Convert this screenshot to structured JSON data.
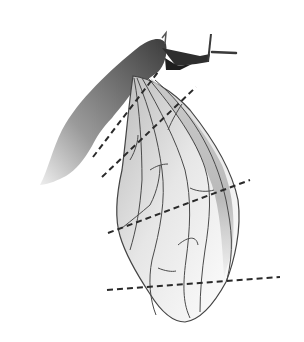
{
  "figure": {
    "background": "#ffffff",
    "colors": {
      "body_dark": "#3a3a3a",
      "body_light": "#d8d8d8",
      "vein": "#4a4a4a",
      "wing_shade": "#bdbdbd",
      "dashed_line": "#2a2a2a"
    },
    "dashed_lines": [
      {
        "id": "line-1",
        "x1": 93,
        "y1": 157,
        "x2": 158,
        "y2": 72
      },
      {
        "id": "line-2",
        "x1": 102,
        "y1": 177,
        "x2": 196,
        "y2": 87
      },
      {
        "id": "line-3",
        "x1": 108,
        "y1": 233,
        "x2": 250,
        "y2": 180
      },
      {
        "id": "line-4",
        "x1": 107,
        "y1": 290,
        "x2": 280,
        "y2": 277
      }
    ]
  }
}
